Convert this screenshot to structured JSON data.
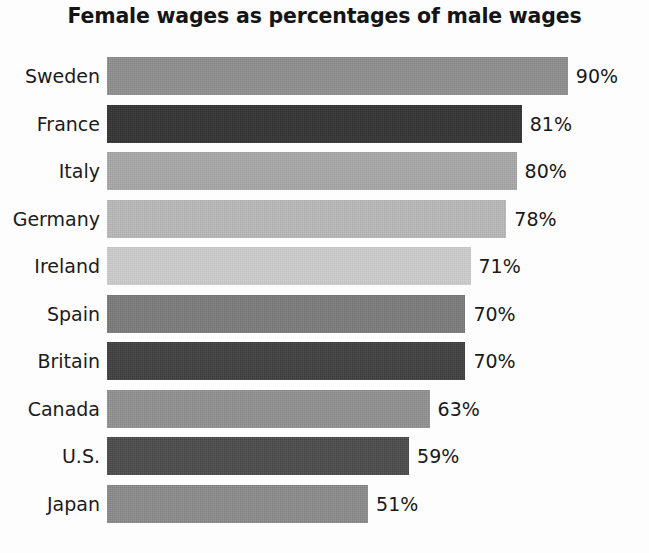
{
  "chart_data": {
    "type": "bar",
    "orientation": "horizontal",
    "title": "Female wages as percentages of male wages",
    "subtitle": "",
    "xlabel": "",
    "ylabel": "",
    "xlim": [
      0,
      100
    ],
    "grid": false,
    "legend": "none",
    "value_suffix": "%",
    "categories": [
      "Sweden",
      "France",
      "Italy",
      "Germany",
      "Ireland",
      "Spain",
      "Britain",
      "Canada",
      "U.S.",
      "Japan"
    ],
    "values": [
      90,
      81,
      80,
      78,
      71,
      70,
      70,
      63,
      59,
      51
    ],
    "data_labels": [
      "90%",
      "81%",
      "80%",
      "78%",
      "71%",
      "70%",
      "70%",
      "63%",
      "59%",
      "51%"
    ],
    "bar_colors": [
      "#8e8e8e",
      "#333333",
      "#a8a8a8",
      "#b9b9b9",
      "#cdcdcd",
      "#7a7a7a",
      "#3f3f3f",
      "#919191",
      "#4a4a4a",
      "#8a8a8a"
    ],
    "series": [
      {
        "name": "Female wages as percentage of male wages",
        "points": [
          {
            "category": "Sweden",
            "value": 90,
            "label": "90%",
            "color": "#8e8e8e"
          },
          {
            "category": "France",
            "value": 81,
            "label": "81%",
            "color": "#333333"
          },
          {
            "category": "Italy",
            "value": 80,
            "label": "80%",
            "color": "#a8a8a8"
          },
          {
            "category": "Germany",
            "value": 78,
            "label": "78%",
            "color": "#b9b9b9"
          },
          {
            "category": "Ireland",
            "value": 71,
            "label": "71%",
            "color": "#cdcdcd"
          },
          {
            "category": "Spain",
            "value": 70,
            "label": "70%",
            "color": "#7a7a7a"
          },
          {
            "category": "Britain",
            "value": 70,
            "label": "70%",
            "color": "#3f3f3f"
          },
          {
            "category": "Canada",
            "value": 63,
            "label": "63%",
            "color": "#919191"
          },
          {
            "category": "U.S.",
            "value": 59,
            "label": "59%",
            "color": "#4a4a4a"
          },
          {
            "category": "Japan",
            "value": 51,
            "label": "51%",
            "color": "#8a8a8a"
          }
        ]
      }
    ]
  },
  "layout": {
    "background": "#fdfdfd",
    "title_color": "#141414",
    "label_color": "#1b1b1b",
    "bar_left_px": 107,
    "bar_height_px": 38,
    "row_pitch_px": 47.5,
    "px_per_unit": 5.12,
    "value_gap_px": 8
  }
}
